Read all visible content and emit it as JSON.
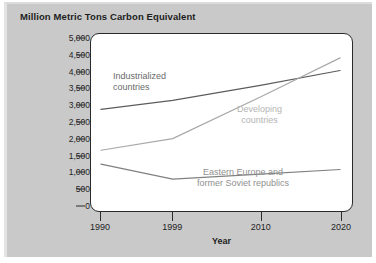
{
  "chart_data": {
    "type": "line",
    "title": "Million Metric Tons Carbon Equivalent",
    "xlabel": "Year",
    "ylabel": "",
    "x": [
      1990,
      1999,
      2010,
      2020
    ],
    "xtick_labels": [
      "1990",
      "1999",
      "2010",
      "2020"
    ],
    "ytick_labels": [
      "5,000",
      "4,500",
      "4,000",
      "3,500",
      "3,000",
      "2,500",
      "2,000",
      "1,500",
      "1,000",
      "500",
      "0"
    ],
    "ytick_values": [
      5000,
      4500,
      4000,
      3500,
      3000,
      2500,
      2000,
      1500,
      1000,
      500,
      0
    ],
    "ylim": [
      0,
      5000
    ],
    "xlim": [
      1990,
      2020
    ],
    "grid": false,
    "legend_position": "inline-annotations",
    "series": [
      {
        "name": "Industrialized countries",
        "label_text": "Industrialized\ncountries",
        "color": "#5c5c5c",
        "values": [
          2880,
          3150,
          3600,
          4050
        ]
      },
      {
        "name": "Developing countries",
        "label_text": "Developing\ncountries",
        "color": "#a8a8a8",
        "values": [
          1650,
          2000,
          3250,
          4430
        ]
      },
      {
        "name": "Eastern Europe and former Soviet republics",
        "label_text": "Eastern Europe and\nformer Soviet republics",
        "color": "#808080",
        "values": [
          1230,
          780,
          930,
          1070
        ]
      }
    ]
  },
  "style": {
    "background": "#c9c9c9",
    "plot_background": "#ffffff",
    "axis_color": "#2a2a2a",
    "title_color": "#1d1d1d"
  }
}
